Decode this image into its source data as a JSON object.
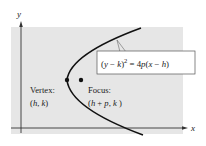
{
  "diagram": {
    "type": "parabola-horizontal-axis",
    "axes": {
      "x_label": "x",
      "y_label": "y"
    },
    "equation": {
      "lhs_open": "(",
      "lhs_var1": "y",
      "lhs_minus": " − ",
      "lhs_var2": "k",
      "lhs_close": ")",
      "exponent": "2",
      "equals": " = 4",
      "rhs_p": "p",
      "rhs_open": "(",
      "rhs_var1": "x",
      "rhs_minus": " − ",
      "rhs_var2": "h",
      "rhs_close": ")"
    },
    "vertex": {
      "title": "Vertex:",
      "coord_open": "(",
      "coord_h": "h",
      "coord_sep": ", ",
      "coord_k": "k",
      "coord_close": ")"
    },
    "focus": {
      "title": "Focus:",
      "coord_open": "(",
      "coord_h": "h",
      "coord_plus": " + ",
      "coord_p": "p",
      "coord_sep": ", ",
      "coord_k": "k",
      "coord_close": " )"
    },
    "colors": {
      "background_panel": "#e6e6e6",
      "curve": "#111111",
      "axis": "#333333",
      "box_border": "#555555",
      "box_fill": "#ffffff"
    }
  }
}
